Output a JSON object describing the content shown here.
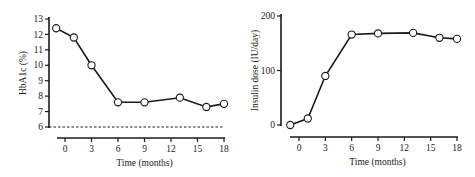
{
  "chart_data": [
    {
      "type": "line",
      "title": "",
      "xlabel": "Time (months)",
      "ylabel": "HbA1c (%)",
      "xticks": [
        0,
        3,
        6,
        9,
        12,
        15,
        18
      ],
      "yticks": [
        6,
        7,
        8,
        9,
        10,
        11,
        12,
        13
      ],
      "xlim": [
        -1.5,
        18
      ],
      "ylim": [
        6,
        13
      ],
      "grid": false,
      "reference_line": {
        "y": 6,
        "style": "dashed"
      },
      "series": [
        {
          "name": "HbA1c",
          "marker": "open-circle",
          "x": [
            -1,
            1,
            3,
            6,
            9,
            13,
            16,
            18
          ],
          "y": [
            12.4,
            11.8,
            10.0,
            7.6,
            7.6,
            7.9,
            7.3,
            7.5
          ]
        }
      ]
    },
    {
      "type": "line",
      "title": "",
      "xlabel": "Time (months)",
      "ylabel": "Insulin dose (IU/day)",
      "xticks": [
        0,
        3,
        6,
        9,
        12,
        15,
        18
      ],
      "yticks": [
        0,
        100,
        200
      ],
      "xlim": [
        -1.5,
        18
      ],
      "ylim": [
        0,
        200
      ],
      "grid": false,
      "series": [
        {
          "name": "Insulin dose",
          "marker": "open-circle",
          "x": [
            -1,
            1,
            3,
            6,
            9,
            13,
            16,
            18
          ],
          "y": [
            0,
            12,
            90,
            166,
            168,
            169,
            160,
            158
          ]
        }
      ]
    }
  ],
  "left_chart": {
    "ylabel": "HbA1c (%)",
    "xlabel": "Time (months)",
    "yticks": [
      "6",
      "7",
      "8",
      "9",
      "10",
      "11",
      "12",
      "13"
    ],
    "xticks": [
      "0",
      "3",
      "6",
      "9",
      "12",
      "15",
      "18"
    ]
  },
  "right_chart": {
    "ylabel": "Insulin dose (IU/day)",
    "xlabel": "Time (months)",
    "yticks": [
      "0",
      "100",
      "200"
    ],
    "xticks": [
      "0",
      "3",
      "6",
      "9",
      "12",
      "15",
      "18"
    ]
  }
}
